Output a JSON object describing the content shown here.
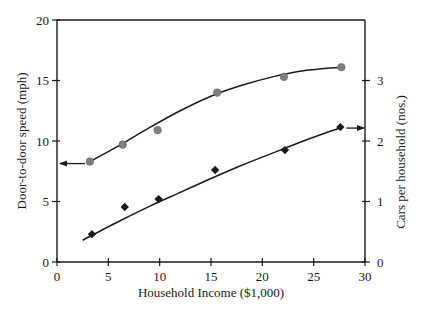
{
  "chart_data": {
    "type": "scatter",
    "title": "",
    "xlabel": "Household Income ($1,000)",
    "ylabel": "Door-to-door speed (mph)",
    "y2label": "Cars per household (nos.)",
    "xlim": [
      0,
      30
    ],
    "ylim": [
      0,
      20
    ],
    "y2lim": [
      0,
      4
    ],
    "x_ticks": [
      0,
      5,
      10,
      15,
      20,
      25,
      30
    ],
    "y_ticks": [
      0,
      5,
      10,
      15,
      20
    ],
    "y2_ticks": [
      0,
      1,
      2,
      3
    ],
    "grid": false,
    "legend": "none",
    "series": [
      {
        "name": "Door-to-door speed",
        "axis": "left",
        "marker": "circle",
        "color": "#808080",
        "x": [
          3.2,
          6.4,
          9.8,
          15.6,
          22.1,
          27.7
        ],
        "y": [
          8.3,
          9.7,
          10.9,
          14.0,
          15.3,
          16.1
        ],
        "trend_x": [
          3.2,
          6,
          9,
          12,
          15,
          18,
          21,
          24,
          27.7
        ],
        "trend_y": [
          8.3,
          9.6,
          11.1,
          12.5,
          13.7,
          14.6,
          15.3,
          15.8,
          16.1
        ],
        "annotation_arrow": "left"
      },
      {
        "name": "Cars per household",
        "axis": "right",
        "marker": "diamond",
        "color": "#1a1a1a",
        "x": [
          3.4,
          6.6,
          9.9,
          15.4,
          22.2,
          27.6
        ],
        "y": [
          0.46,
          0.91,
          1.04,
          1.52,
          1.85,
          2.23
        ],
        "trend_x": [
          2.5,
          6,
          9,
          12,
          15,
          18,
          21,
          24,
          27.6
        ],
        "trend_y": [
          0.36,
          0.67,
          0.92,
          1.15,
          1.38,
          1.6,
          1.8,
          2.0,
          2.22
        ],
        "annotation_arrow": "right"
      }
    ]
  }
}
